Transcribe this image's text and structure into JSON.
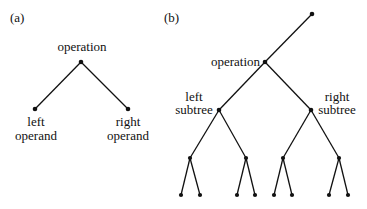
{
  "panel_a": {
    "label": "(a)",
    "root_label": "operation",
    "left_label_line1": "left",
    "left_label_line2": "operand",
    "right_label_line1": "right",
    "right_label_line2": "operand"
  },
  "panel_b": {
    "label": "(b)",
    "operation_label": "operation",
    "left_label_line1": "left",
    "left_label_line2": "subtree",
    "right_label_line1": "right",
    "right_label_line2": "subtree"
  },
  "colors": {
    "ink": "#111111",
    "background": "#ffffff"
  }
}
